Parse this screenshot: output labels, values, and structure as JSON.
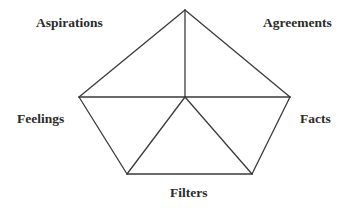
{
  "diagram": {
    "type": "pentagon-framework",
    "stroke_color": "#3a3a3a",
    "text_color": "#2b2b2b",
    "labels": {
      "top_left": "Aspirations",
      "top_right": "Agreements",
      "left": "Feelings",
      "right": "Facts",
      "bottom": "Filters"
    },
    "nodes": [
      "top",
      "left",
      "right",
      "bottom-left",
      "bottom-right",
      "center"
    ],
    "edges": [
      [
        "top",
        "left"
      ],
      [
        "top",
        "right"
      ],
      [
        "left",
        "bottom-left"
      ],
      [
        "right",
        "bottom-right"
      ],
      [
        "bottom-left",
        "bottom-right"
      ],
      [
        "left",
        "right"
      ],
      [
        "top",
        "center"
      ],
      [
        "center",
        "bottom-left"
      ],
      [
        "center",
        "bottom-right"
      ]
    ]
  }
}
